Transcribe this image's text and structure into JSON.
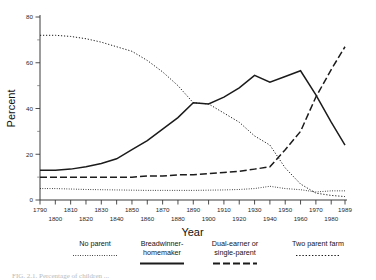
{
  "figure": {
    "caption_fragment": "FIG. 2.1.  Percentage of children  ..."
  },
  "axes": {
    "ylabel": "Percent",
    "xlabel": "Year",
    "y_ticks": [
      "0",
      "20",
      "40",
      "60",
      "80"
    ],
    "x_ticks_top": [
      "1790",
      "1810",
      "1830",
      "1850",
      "1870",
      "1890",
      "1910",
      "1930",
      "1950",
      "1970",
      "1989"
    ],
    "x_ticks_bottom": [
      "1800",
      "1820",
      "1840",
      "1860",
      "1880",
      "1900",
      "1920",
      "1940",
      "1960",
      "1980"
    ]
  },
  "legend": {
    "entries": [
      {
        "label": "No parent",
        "style": "dotted-fine"
      },
      {
        "label": "Breadwinner-\nhomemaker",
        "style": "solid"
      },
      {
        "label": "Dual-earner or\nsingle-parent",
        "style": "dashdot"
      },
      {
        "label": "Two parent farm",
        "style": "dotted-sparse"
      }
    ]
  },
  "chart_data": {
    "type": "line",
    "title": "",
    "xlabel": "Year",
    "ylabel": "Percent",
    "xlim": [
      1790,
      1989
    ],
    "ylim": [
      0,
      80
    ],
    "grid": false,
    "legend_position": "below",
    "x": [
      1790,
      1800,
      1810,
      1820,
      1830,
      1840,
      1850,
      1860,
      1870,
      1880,
      1890,
      1900,
      1910,
      1920,
      1930,
      1940,
      1950,
      1960,
      1970,
      1980,
      1989
    ],
    "series": [
      {
        "name": "Two parent farm",
        "style": "dotted-sparse",
        "values": [
          72,
          72,
          71.5,
          70.5,
          69,
          67,
          65,
          61,
          56,
          50,
          42.5,
          42,
          38,
          34,
          28,
          24,
          14,
          7,
          3,
          2,
          1.5
        ]
      },
      {
        "name": "Breadwinner-homemaker",
        "style": "solid",
        "values": [
          13,
          13,
          13.5,
          14.5,
          16,
          18,
          22,
          26,
          31,
          36,
          42.5,
          42,
          45,
          49,
          54.5,
          51.5,
          54,
          56.5,
          46,
          34,
          24
        ]
      },
      {
        "name": "Dual-earner or single-parent",
        "style": "dashdot",
        "values": [
          10,
          10,
          10,
          10,
          10,
          10,
          10,
          10.5,
          10.5,
          11,
          11,
          11.5,
          12,
          12.5,
          13.5,
          14.5,
          22,
          30,
          45,
          57,
          67
        ]
      },
      {
        "name": "No parent",
        "style": "dotted-fine",
        "values": [
          5,
          5,
          4.8,
          4.6,
          4.5,
          4.4,
          4.3,
          4.2,
          4.2,
          4.2,
          4.2,
          4.3,
          4.4,
          4.6,
          5,
          6,
          5,
          4.5,
          3.5,
          4,
          4
        ]
      }
    ]
  }
}
